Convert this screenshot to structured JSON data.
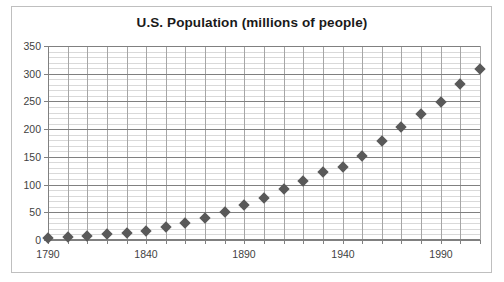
{
  "chart_data": {
    "type": "scatter",
    "title": "U.S. Population (millions of people)",
    "xlabel": "",
    "ylabel": "",
    "xlim": [
      1790,
      2010
    ],
    "ylim": [
      0,
      350
    ],
    "y_ticks": [
      0,
      50,
      100,
      150,
      200,
      250,
      300,
      350
    ],
    "y_tick_labels": [
      "0",
      "50",
      "100",
      "150",
      "200",
      "250",
      "300",
      "350"
    ],
    "y_minor_step": 10,
    "x_ticks": [
      1790,
      1800,
      1810,
      1820,
      1830,
      1840,
      1850,
      1860,
      1870,
      1880,
      1890,
      1900,
      1910,
      1920,
      1930,
      1940,
      1950,
      1960,
      1970,
      1980,
      1990,
      2000,
      2010
    ],
    "x_tick_labels": [
      "1790",
      "1840",
      "1890",
      "1940",
      "1990"
    ],
    "x_labeled_ticks": [
      1790,
      1840,
      1890,
      1940,
      1990
    ],
    "grid": true,
    "legend": false,
    "marker": "diamond",
    "marker_color": "#595959",
    "x": [
      1790,
      1800,
      1810,
      1820,
      1830,
      1840,
      1850,
      1860,
      1870,
      1880,
      1890,
      1900,
      1910,
      1920,
      1930,
      1940,
      1950,
      1960,
      1970,
      1980,
      1990,
      2000,
      2010
    ],
    "values": [
      4,
      5,
      7,
      10,
      13,
      17,
      23,
      31,
      39,
      50,
      63,
      76,
      92,
      106,
      123,
      132,
      151,
      179,
      203,
      227,
      249,
      281,
      309
    ],
    "series": [
      {
        "name": "U.S. Population",
        "values": [
          4,
          5,
          7,
          10,
          13,
          17,
          23,
          31,
          39,
          50,
          63,
          76,
          92,
          106,
          123,
          132,
          151,
          179,
          203,
          227,
          249,
          281,
          309
        ]
      }
    ]
  },
  "colors": {
    "marker": "#595959",
    "major_grid": "#808080",
    "minor_grid": "#d9d9d9",
    "vertical_grid": "#a6a6a6",
    "frame_border": "#bfbfbf",
    "title_text": "#1a1a1a",
    "tick_text": "#3f3f3f",
    "background": "#ffffff"
  }
}
